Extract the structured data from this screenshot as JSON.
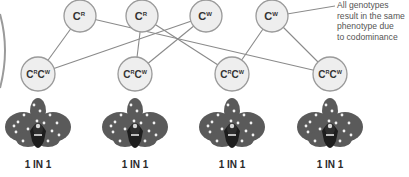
{
  "annotation": {
    "lines": [
      "All genotypes",
      "result in the same",
      "phenotype due",
      "to codominance"
    ]
  },
  "parents": [
    {
      "allele": "C",
      "superscript": "R",
      "x": 80,
      "y": 16
    },
    {
      "allele": "C",
      "superscript": "R",
      "x": 142,
      "y": 16
    },
    {
      "allele": "C",
      "superscript": "W",
      "x": 206,
      "y": 16
    },
    {
      "allele": "C",
      "superscript": "W",
      "x": 272,
      "y": 16
    }
  ],
  "offspring": [
    {
      "genotype": "CRCW",
      "allele1": "C",
      "sup1": "R",
      "allele2": "C",
      "sup2": "W",
      "x": 38,
      "y": 74,
      "ratio": "1 IN 1"
    },
    {
      "genotype": "CRCW",
      "allele1": "C",
      "sup1": "R",
      "allele2": "C",
      "sup2": "W",
      "x": 135,
      "y": 74,
      "ratio": "1 IN 1"
    },
    {
      "genotype": "CRCW",
      "allele1": "C",
      "sup1": "R",
      "allele2": "C",
      "sup2": "W",
      "x": 232,
      "y": 74,
      "ratio": "1 IN 1"
    },
    {
      "genotype": "CRCW",
      "allele1": "C",
      "sup1": "R",
      "allele2": "C",
      "sup2": "W",
      "x": 330,
      "y": 74,
      "ratio": "1 IN 1"
    }
  ],
  "connections": [
    {
      "from": 0,
      "to": 0
    },
    {
      "from": 0,
      "to": 3
    },
    {
      "from": 1,
      "to": 1
    },
    {
      "from": 1,
      "to": 2
    },
    {
      "from": 2,
      "to": 0
    },
    {
      "from": 2,
      "to": 1
    },
    {
      "from": 3,
      "to": 2
    },
    {
      "from": 3,
      "to": 3
    }
  ],
  "colors": {
    "circle_fill": "#eeeeee",
    "circle_stroke": "#9a9a9a",
    "line": "#8a8a8a",
    "flower_petal": "#5a5a5a",
    "flower_dark": "#2e2e2e",
    "flower_lip": "#1e1e1e",
    "dot": "#f2f2f2"
  }
}
